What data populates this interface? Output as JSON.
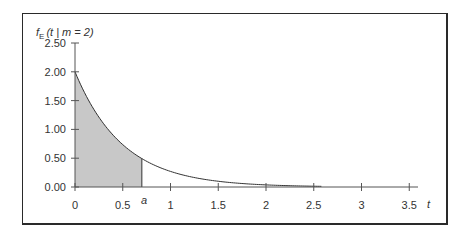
{
  "chart_data": {
    "type": "area",
    "title": "",
    "ylabel": "f_E(t | m=2)",
    "ylabel_parts": {
      "f": "f",
      "sub": "E",
      "rest": "(t | m = 2)"
    },
    "xlabel": "t",
    "function": "f(t) = 2 e^{-2t}",
    "x_ticks": [
      "0",
      "0.5",
      "1",
      "1.5",
      "2",
      "2.5",
      "3",
      "3.5"
    ],
    "x_tick_values": [
      0,
      0.5,
      1,
      1.5,
      2,
      2.5,
      3,
      3.5
    ],
    "y_ticks": [
      "0.00",
      "0.50",
      "1.00",
      "1.50",
      "2.00",
      "2.50"
    ],
    "y_tick_values": [
      0,
      0.5,
      1.0,
      1.5,
      2.0,
      2.5
    ],
    "xlim": [
      0,
      3.75
    ],
    "ylim": [
      0,
      2.5
    ],
    "grid": false,
    "legend": null,
    "series": [
      {
        "name": "f_E(t | m=2)",
        "x": [
          0,
          0.1,
          0.2,
          0.3,
          0.4,
          0.5,
          0.6,
          0.7,
          0.8,
          0.9,
          1.0,
          1.25,
          1.5,
          1.75,
          2.0,
          2.25,
          2.5
        ],
        "values": [
          2.0,
          1.64,
          1.34,
          1.1,
          0.9,
          0.74,
          0.6,
          0.49,
          0.4,
          0.33,
          0.27,
          0.16,
          0.1,
          0.06,
          0.04,
          0.02,
          0.01
        ]
      }
    ],
    "shaded_region": {
      "from": 0,
      "to": 0.7,
      "color": "#c8c8c8",
      "label": "a"
    },
    "annotations": [
      {
        "text": "a",
        "x": 0.7,
        "position": "below x-axis"
      }
    ],
    "colors": {
      "line": "#333333",
      "fill": "#c8c8c8",
      "axis": "#555555"
    }
  }
}
